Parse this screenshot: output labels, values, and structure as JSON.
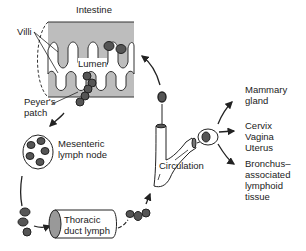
{
  "diagram": {
    "labels": {
      "intestine": "Intestine",
      "villi": "Villi",
      "lumen": "Lumen",
      "peyers_patch": "Peyer's\npatch",
      "mesenteric": "Mesenteric\nlymph node",
      "thoracic": "Thoracic\nduct lymph",
      "circulation": "Circulation",
      "mammary": "Mammary\ngland",
      "cervix": "Cervix\nVagina\nUterus",
      "bronchus": "Bronchus–\nassociated\nlymphoid\ntissue"
    },
    "colors": {
      "tissue_fill": "#bdbdbd",
      "cell_fill": "#555555",
      "outline": "#222222",
      "background": "#ffffff"
    }
  }
}
